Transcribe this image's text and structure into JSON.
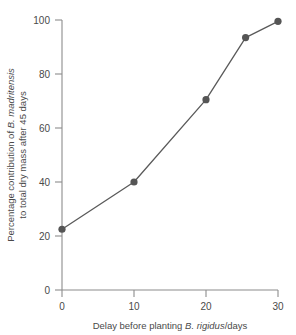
{
  "chart_data": {
    "type": "line",
    "title": "",
    "xlabel": "Delay before planting B. rigidus/days",
    "xlabel_plain": "Delay before planting ",
    "xlabel_italic": "B. rigidus",
    "xlabel_suffix": "/days",
    "ylabel": "Percentage contribution of B. madritensis to total dry mass after 45 days",
    "ylabel_line1_plain": "Percentage contribution of ",
    "ylabel_line1_italic": "B. madritensis",
    "ylabel_line2": "to total dry mass after 45 days",
    "x": [
      0,
      10,
      20,
      25.5,
      30
    ],
    "values": [
      22.5,
      40,
      70.5,
      93.5,
      99.5
    ],
    "series": [
      {
        "name": "B. madritensis percentage contribution",
        "points": [
          {
            "x": 0,
            "y": 22.5
          },
          {
            "x": 10,
            "y": 40
          },
          {
            "x": 20,
            "y": 70.5
          },
          {
            "x": 25.5,
            "y": 93.5
          },
          {
            "x": 30,
            "y": 99.5
          }
        ]
      }
    ],
    "xlim": [
      0,
      30
    ],
    "ylim": [
      0,
      100
    ],
    "xticks": [
      0,
      10,
      20,
      30
    ],
    "xtick_labels": [
      "0",
      "10",
      "20",
      "30"
    ],
    "yticks": [
      0,
      20,
      40,
      60,
      80,
      100
    ],
    "ytick_labels": [
      "0",
      "20",
      "40",
      "60",
      "80",
      "100"
    ],
    "grid": false,
    "legend": "none",
    "marker": "circle",
    "line_color": "#5a5a5a",
    "marker_color": "#555555",
    "axis_color": "#8c8c8c",
    "background_color": "#ffffff"
  }
}
